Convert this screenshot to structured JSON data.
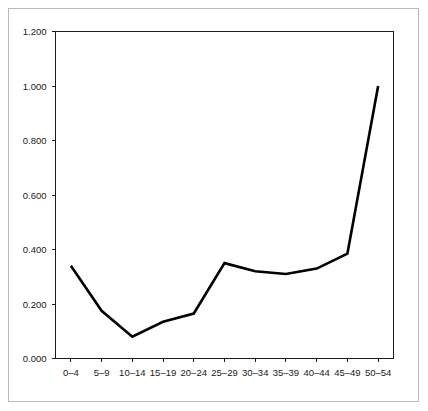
{
  "chart_data": {
    "type": "line",
    "title": "",
    "subtitle": "",
    "xlabel": "",
    "ylabel": "",
    "categories": [
      "0–4",
      "5–9",
      "10–14",
      "15–19",
      "20–24",
      "25–29",
      "30–34",
      "35–39",
      "40–44",
      "45–49",
      "50–54"
    ],
    "values": [
      0.34,
      0.175,
      0.08,
      0.135,
      0.165,
      0.35,
      0.32,
      0.31,
      0.33,
      0.385,
      1.0
    ],
    "series": [
      {
        "name": "rate",
        "values": [
          0.34,
          0.175,
          0.08,
          0.135,
          0.165,
          0.35,
          0.32,
          0.31,
          0.33,
          0.385,
          1.0
        ],
        "color": "#000000"
      }
    ],
    "ylim": [
      0.0,
      1.2
    ],
    "ytick_values": [
      0.0,
      0.2,
      0.4,
      0.6,
      0.8,
      1.0,
      1.2
    ],
    "ytick_labels": [
      "0.000",
      "0.200",
      "0.400",
      "0.600",
      "0.800",
      "1.000",
      "1.200"
    ],
    "xtick_labels": [
      "0–4",
      "5–9",
      "10–14",
      "15–19",
      "20–24",
      "25–29",
      "30–34",
      "35–39",
      "40–44",
      "45–49",
      "50–54"
    ],
    "grid": false,
    "legend": false,
    "legend_position": "none",
    "axis_color": "#1a1a1a",
    "line_color": "#000000",
    "background_color": "#ffffff",
    "frame_border_color": "#b9b9b9"
  }
}
